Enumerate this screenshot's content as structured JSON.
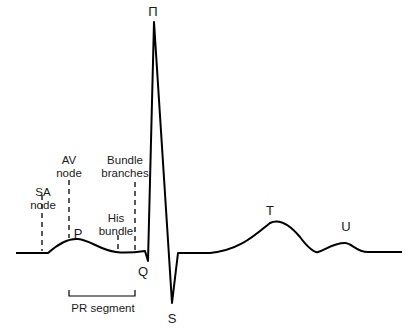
{
  "diagram": {
    "type": "ecg-waveform",
    "waves": {
      "p": "P",
      "q": "Q",
      "r": "Π",
      "s": "S",
      "t": "T",
      "u": "U"
    },
    "markers": {
      "sa_node": "SA\nnode",
      "av_node": "AV\nnode",
      "his_bundle": "His\nbundle",
      "bundle_branches": "Bundle\nbranches"
    },
    "segment_label": "PR segment",
    "colors": {
      "line": "#000000",
      "text": "#1a1a1a",
      "background": "#ffffff"
    }
  }
}
